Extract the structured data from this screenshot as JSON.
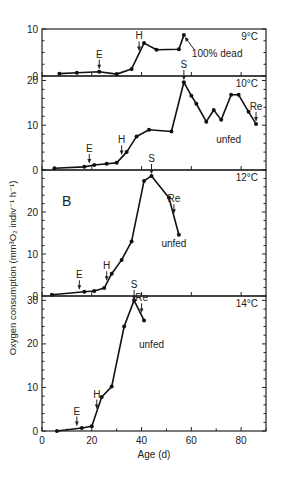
{
  "chart_data": {
    "type": "line",
    "panel_label": "B",
    "xlabel": "Age (d)",
    "ylabel": "Oxygen consumption (mm³O₂ indiv⁻¹ h⁻¹)",
    "x_ticks": [
      0,
      20,
      40,
      60,
      80
    ],
    "xlim": [
      0,
      90
    ],
    "panels": [
      {
        "temperature": "9°C",
        "ylim": [
          0,
          10
        ],
        "y_ticks": [
          0,
          10
        ],
        "x": [
          7,
          14,
          23,
          30,
          36,
          41,
          46,
          55,
          57
        ],
        "y": [
          0.5,
          0.7,
          0.9,
          0.4,
          1.5,
          7.0,
          5.6,
          5.7,
          8.7
        ],
        "annotations": [
          {
            "text": "E",
            "x": 23,
            "type": "arrow"
          },
          {
            "text": "H",
            "x": 39,
            "type": "arrow"
          },
          {
            "text": "100% dead",
            "x": 57,
            "type": "pointer"
          }
        ]
      },
      {
        "temperature": "10°C",
        "ylim": [
          0,
          21
        ],
        "y_ticks": [
          0,
          10,
          20
        ],
        "x": [
          5,
          17,
          21,
          26,
          30,
          34,
          38,
          43,
          52,
          57,
          60,
          62,
          66,
          69,
          72,
          76,
          79,
          83,
          86
        ],
        "y": [
          0.4,
          0.7,
          1.1,
          1.4,
          1.6,
          4.0,
          7.5,
          9.0,
          8.6,
          19.6,
          16.6,
          14.8,
          10.8,
          13.4,
          11.2,
          16.8,
          16.8,
          13.0,
          10.3
        ],
        "annotations": [
          {
            "text": "S",
            "x": 57,
            "type": "arrow-from-above-panel"
          },
          {
            "text": "E",
            "x": 19,
            "type": "arrow"
          },
          {
            "text": "H",
            "x": 32,
            "type": "arrow"
          },
          {
            "text": "Re",
            "x": 86,
            "type": "arrow"
          },
          {
            "text": "unfed",
            "x": 75,
            "type": "label"
          }
        ]
      },
      {
        "temperature": "12°C",
        "ylim": [
          0,
          30
        ],
        "y_ticks": [
          0,
          10,
          20
        ],
        "x": [
          4,
          17,
          21,
          25,
          28,
          32,
          36,
          41,
          44,
          51,
          55
        ],
        "y": [
          0.3,
          1.0,
          1.2,
          1.9,
          5.3,
          8.6,
          13.0,
          27.4,
          28.6,
          23.4,
          14.6
        ],
        "annotations": [
          {
            "text": "S",
            "x": 44,
            "type": "arrow-from-above-panel"
          },
          {
            "text": "E",
            "x": 15,
            "type": "arrow"
          },
          {
            "text": "H",
            "x": 26,
            "type": "arrow"
          },
          {
            "text": "Re",
            "x": 53,
            "type": "arrow"
          },
          {
            "text": "unfed",
            "x": 53,
            "type": "label"
          }
        ]
      },
      {
        "temperature": "14°C",
        "ylim": [
          0,
          31
        ],
        "y_ticks": [
          0,
          10,
          20,
          30
        ],
        "x": [
          6,
          16,
          20,
          24,
          28,
          33,
          37,
          41
        ],
        "y": [
          0.0,
          0.7,
          1.1,
          7.8,
          10.2,
          24.0,
          30.0,
          25.4
        ],
        "annotations": [
          {
            "text": "S",
            "x": 37,
            "type": "arrow-from-above-panel"
          },
          {
            "text": "E",
            "x": 14,
            "type": "arrow"
          },
          {
            "text": "H",
            "x": 22,
            "type": "arrow"
          },
          {
            "text": "Re",
            "x": 40,
            "type": "arrow"
          },
          {
            "text": "unfed",
            "x": 44,
            "type": "label"
          }
        ]
      }
    ],
    "grid": false,
    "legend": null
  }
}
